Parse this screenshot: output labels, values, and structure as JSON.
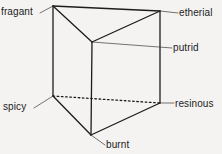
{
  "figure": {
    "type": "line-diagram",
    "background_color": "#f4f3f1",
    "line_color": "#1c1c1c",
    "text_color": "#1c1c1c",
    "width": 222,
    "height": 154
  },
  "labels": {
    "fragant": "fragant",
    "etherial": "etherial",
    "putrid": "putrid",
    "spicy": "spicy",
    "resinous": "resinous",
    "burnt": "burnt"
  },
  "geometry": {
    "vertices": {
      "top_left": {
        "x": 53,
        "y": 6,
        "label": "fragant"
      },
      "top_right": {
        "x": 160,
        "y": 11,
        "label": "etherial"
      },
      "top_front": {
        "x": 92,
        "y": 42,
        "label": "putrid"
      },
      "bottom_left": {
        "x": 53,
        "y": 96,
        "label": "spicy"
      },
      "bottom_right": {
        "x": 160,
        "y": 103,
        "label": "resinous"
      },
      "bottom_front": {
        "x": 91,
        "y": 135,
        "label": "burnt"
      }
    },
    "solid_edges": [
      [
        53,
        6,
        160,
        11
      ],
      [
        53,
        6,
        92,
        42
      ],
      [
        92,
        42,
        160,
        11
      ],
      [
        53,
        6,
        53,
        96
      ],
      [
        160,
        11,
        160,
        103
      ],
      [
        92,
        42,
        91,
        135
      ],
      [
        53,
        96,
        91,
        135
      ],
      [
        91,
        135,
        160,
        103
      ]
    ],
    "dotted_edges": [
      [
        53,
        96,
        160,
        103
      ]
    ],
    "leader_lines": [
      {
        "label": "fragant",
        "from": [
          40,
          13
        ],
        "to": [
          53,
          6
        ]
      },
      {
        "label": "etherial",
        "from": [
          160,
          11
        ],
        "to": [
          178,
          13
        ]
      },
      {
        "label": "putrid",
        "from": [
          92,
          42
        ],
        "to": [
          172,
          48
        ]
      },
      {
        "label": "spicy",
        "from": [
          34,
          108
        ],
        "to": [
          53,
          96
        ]
      },
      {
        "label": "resinous",
        "from": [
          160,
          103
        ],
        "to": [
          174,
          103
        ]
      },
      {
        "label": "burnt",
        "from": [
          91,
          135
        ],
        "to": [
          105,
          145
        ]
      }
    ]
  }
}
